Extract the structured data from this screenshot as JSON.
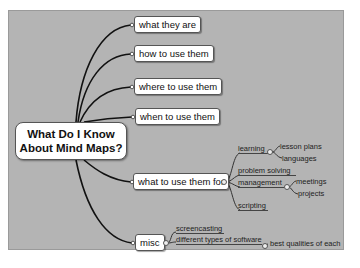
{
  "mindmap": {
    "central": {
      "line1": "What Do I Know",
      "line2": "About Mind Maps?"
    },
    "branches": [
      {
        "label": "what they are"
      },
      {
        "label": "how to use them"
      },
      {
        "label": "where to use them"
      },
      {
        "label": "when to use them"
      },
      {
        "label": "what to use them for",
        "children": [
          {
            "label": "learning",
            "children": [
              {
                "label": "lesson plans"
              },
              {
                "label": "languages"
              }
            ]
          },
          {
            "label": "problem solving"
          },
          {
            "label": "management",
            "children": [
              {
                "label": "meetings"
              },
              {
                "label": "projects"
              }
            ]
          },
          {
            "label": "scripting"
          }
        ]
      },
      {
        "label": "misc",
        "children": [
          {
            "label": "screencasting"
          },
          {
            "label": "different types of software",
            "children": [
              {
                "label": "best qualities of each"
              }
            ]
          }
        ]
      }
    ]
  },
  "colors": {
    "background": "#b4b4b4",
    "node_fill": "#ffffff",
    "link": "#111111"
  }
}
